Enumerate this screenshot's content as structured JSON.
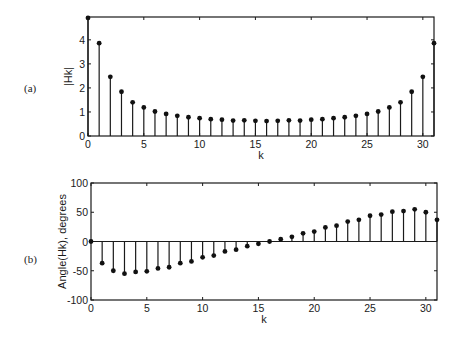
{
  "figure": {
    "panel_labels": [
      "(a)",
      "(b)"
    ]
  },
  "chart_data": [
    {
      "type": "stem",
      "title": "",
      "panel_label": "(a)",
      "xlabel": "k",
      "ylabel": "|Hk|",
      "xlim": [
        0,
        31
      ],
      "ylim": [
        0,
        4.95
      ],
      "xticks": [
        0,
        5,
        10,
        15,
        20,
        25,
        30
      ],
      "yticks": [
        0,
        1,
        2,
        3,
        4
      ],
      "grid": false,
      "x": [
        0,
        1,
        2,
        3,
        4,
        5,
        6,
        7,
        8,
        9,
        10,
        11,
        12,
        13,
        14,
        15,
        16,
        17,
        18,
        19,
        20,
        21,
        22,
        23,
        24,
        25,
        26,
        27,
        28,
        29,
        30,
        31
      ],
      "values": [
        4.91,
        3.86,
        2.46,
        1.84,
        1.4,
        1.19,
        1.02,
        0.92,
        0.84,
        0.78,
        0.74,
        0.7,
        0.68,
        0.64,
        0.65,
        0.63,
        0.62,
        0.63,
        0.65,
        0.64,
        0.68,
        0.7,
        0.74,
        0.78,
        0.84,
        0.92,
        1.02,
        1.19,
        1.4,
        1.84,
        2.46,
        3.86
      ]
    },
    {
      "type": "stem",
      "title": "",
      "panel_label": "(b)",
      "xlabel": "k",
      "ylabel": "Angle(Hk), degrees",
      "xlim": [
        0,
        31
      ],
      "ylim": [
        -100,
        100
      ],
      "xticks": [
        0,
        5,
        10,
        15,
        20,
        25,
        30
      ],
      "yticks": [
        -100,
        -50,
        0,
        50,
        100
      ],
      "grid": false,
      "x": [
        0,
        1,
        2,
        3,
        4,
        5,
        6,
        7,
        8,
        9,
        10,
        11,
        12,
        13,
        14,
        15,
        16,
        17,
        18,
        19,
        20,
        21,
        22,
        23,
        24,
        25,
        26,
        27,
        28,
        29,
        30,
        31
      ],
      "values": [
        0,
        -37,
        -50,
        -55,
        -52,
        -51,
        -46,
        -44,
        -37,
        -34,
        -27,
        -24,
        -17,
        -14,
        -8,
        -4,
        0,
        4,
        8,
        14,
        17,
        24,
        27,
        34,
        37,
        44,
        46,
        51,
        52,
        55,
        50,
        37
      ]
    }
  ],
  "style": {
    "line_color": "#1a1a1a",
    "marker_color": "#111111",
    "background": "#ffffff"
  }
}
